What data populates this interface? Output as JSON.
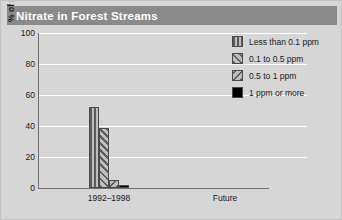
{
  "title": "Nitrate in Forest Streams",
  "chart_data": {
    "type": "bar",
    "title": "Nitrate in Forest Streams",
    "xlabel": "",
    "ylabel": "% of Stream Sites Tested",
    "ylim": [
      0,
      100
    ],
    "ytick_labels": [
      "0",
      "20",
      "40",
      "60",
      "80",
      "100"
    ],
    "ytick_values": [
      0,
      20,
      40,
      60,
      80,
      100
    ],
    "grid": true,
    "legend_position": "upper right",
    "categories": [
      "1992–1998",
      "Future"
    ],
    "series": [
      {
        "name": "Less than 0.1 ppm",
        "pattern": "vertical-stripes",
        "values": [
          52,
          null
        ]
      },
      {
        "name": "0.1 to 0.5 ppm",
        "pattern": "forward-diagonal",
        "values": [
          39,
          null
        ]
      },
      {
        "name": "0.5 to 1 ppm",
        "pattern": "backward-diagonal",
        "values": [
          5,
          null
        ]
      },
      {
        "name": "1 ppm or more",
        "pattern": "solid-black",
        "values": [
          2,
          null
        ]
      }
    ]
  },
  "legend": {
    "items": [
      {
        "label": "Less than 0.1 ppm"
      },
      {
        "label": "0.1 to 0.5 ppm"
      },
      {
        "label": "0.5 to 1 ppm"
      },
      {
        "label": "1 ppm or more"
      }
    ]
  },
  "colors": {
    "figure_background": "#d6d6d6",
    "title_bar": "#8a8a8a",
    "title_text": "#ffffff",
    "gridline": "#ffffff",
    "axis_line": "#6f6f6f",
    "bar_light": "#bdbdbd",
    "bar_dark": "#5c5c5c",
    "bar_solid": "#000000",
    "text": "#1a1a1a"
  }
}
